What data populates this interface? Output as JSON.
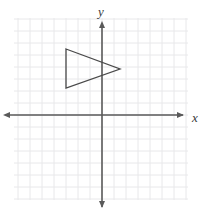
{
  "figure": {
    "name": "coordinate-plane-with-triangle",
    "background_color": "#ffffff",
    "width": 209,
    "height": 217
  },
  "grid": {
    "visible": true,
    "cell_size_px": 12,
    "color": "#e8e8ea",
    "minor_color": "#f2f2f4",
    "left_px": 14,
    "top_px": 18,
    "right_px": 188,
    "bottom_px": 200,
    "columns": 14,
    "rows": 15
  },
  "axes": {
    "color": "#5a5a5a",
    "stroke_width": 1.6,
    "origin_px": {
      "x": 102,
      "y": 115
    },
    "x_axis": {
      "label": "x",
      "label_px": {
        "x": 195,
        "y": 119
      },
      "start_px": {
        "x": 9,
        "y": 115
      },
      "end_px": {
        "x": 183,
        "y": 115
      },
      "arrows": "both"
    },
    "y_axis": {
      "label": "y",
      "label_px": {
        "x": 101,
        "y": 13
      },
      "start_px": {
        "x": 102,
        "y": 27
      },
      "end_px": {
        "x": 102,
        "y": 207
      },
      "arrows": "both"
    }
  },
  "shapes": [
    {
      "name": "triangle",
      "type": "polygon",
      "stroke_color": "#4a4a4a",
      "stroke_width": 1.3,
      "fill": "none",
      "vertices_px": [
        {
          "x": 66,
          "y": 49
        },
        {
          "x": 120,
          "y": 69
        },
        {
          "x": 66,
          "y": 88
        }
      ],
      "vertices_grid": [
        {
          "x": -3,
          "y": 5.5
        },
        {
          "x": 1.5,
          "y": 3.8
        },
        {
          "x": -3,
          "y": 2.25
        }
      ],
      "quadrant": "II",
      "orientation": "pointing-right"
    }
  ]
}
